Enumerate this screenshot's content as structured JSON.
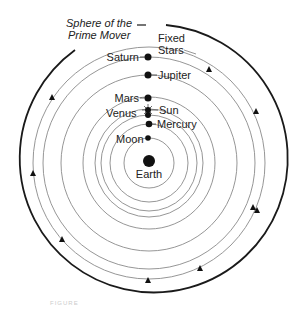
{
  "diagram": {
    "title_label_line1": "Sphere of the",
    "title_label_line2": "Prime Mover",
    "fixed_stars_line1": "Fixed",
    "fixed_stars_line2": "Stars",
    "center_body": "Earth",
    "bodies": [
      {
        "name": "Saturn",
        "side": "left"
      },
      {
        "name": "Jupiter",
        "side": "right"
      },
      {
        "name": "Mars",
        "side": "left"
      },
      {
        "name": "Sun",
        "side": "right"
      },
      {
        "name": "Venus",
        "side": "left"
      },
      {
        "name": "Mercury",
        "side": "right"
      },
      {
        "name": "Moon",
        "side": "left"
      }
    ],
    "caption": "FIGURE",
    "colors": {
      "outer_sphere": "#1a1a1a",
      "orbit": "#8a8a8a",
      "body": "#111111",
      "text": "#222222"
    }
  }
}
